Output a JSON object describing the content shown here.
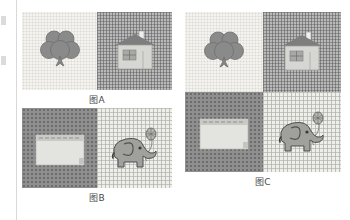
{
  "page": {
    "background_color": "#ffffff",
    "gutter_rule_color": "#d9d9d9"
  },
  "motifs": {
    "clover": {
      "name": "clover-motif",
      "color": "#8a8a8a",
      "outline_color": "#6b6b6b"
    },
    "house": {
      "name": "house-motif",
      "roof_color": "#7e7e7e",
      "body_color": "#d6d6d2",
      "window_color": "#a8a8a6",
      "chimney_color": "#efefee"
    },
    "card": {
      "name": "greeting-card-motif",
      "paper_color": "#e3e3e0",
      "band_color": "#c9c9c6",
      "dash_color": "#8f8f8f"
    },
    "elephant": {
      "name": "elephant-motif",
      "body_color": "#a0a09c",
      "outline_color": "#4f4f4f",
      "eye_color": "#3a3a3a",
      "balloon_color": "#b4b4b0",
      "string_color": "#7a7a78"
    }
  },
  "figures": [
    {
      "id": "figure-a",
      "caption": "图A",
      "layout": "1x2",
      "tiles": [
        {
          "id": "a-tile-1",
          "pattern": "dots-light",
          "pattern_label": "浅色点阵底纹",
          "motif": "clover"
        },
        {
          "id": "a-tile-2",
          "pattern": "grid-dark",
          "pattern_label": "深色网格底纹",
          "motif": "house"
        }
      ]
    },
    {
      "id": "figure-b",
      "caption": "图B",
      "layout": "1x2",
      "tiles": [
        {
          "id": "b-tile-1",
          "pattern": "check-dark",
          "pattern_label": "深色圆点底纹",
          "motif": "card"
        },
        {
          "id": "b-tile-2",
          "pattern": "grid-light",
          "pattern_label": "浅色网格底纹",
          "motif": "elephant"
        }
      ]
    },
    {
      "id": "figure-c",
      "caption": "图C",
      "layout": "2x2",
      "tiles": [
        {
          "id": "c-tile-1",
          "pattern": "dots-light",
          "pattern_label": "浅色点阵底纹",
          "motif": "clover"
        },
        {
          "id": "c-tile-2",
          "pattern": "grid-dark",
          "pattern_label": "深色网格底纹",
          "motif": "house"
        },
        {
          "id": "c-tile-3",
          "pattern": "check-dark",
          "pattern_label": "深色圆点底纹",
          "motif": "card"
        },
        {
          "id": "c-tile-4",
          "pattern": "grid-light",
          "pattern_label": "浅色网格底纹",
          "motif": "elephant"
        }
      ]
    }
  ]
}
